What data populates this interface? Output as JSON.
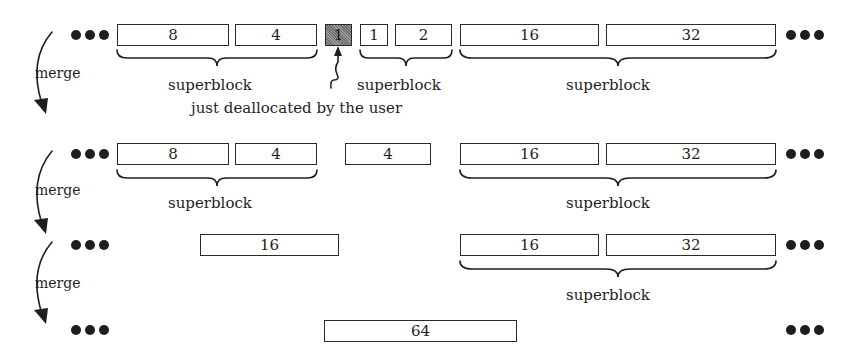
{
  "diagram": {
    "title": "",
    "merge_label": "merge",
    "superblock_label": "superblock",
    "annotation": "just deallocated by the user",
    "rows": [
      {
        "id": "row1",
        "blocks": [
          {
            "size": "8",
            "state": "free"
          },
          {
            "size": "4",
            "state": "free"
          },
          {
            "size": "1",
            "state": "just-deallocated"
          },
          {
            "size": "1",
            "state": "free"
          },
          {
            "size": "2",
            "state": "free"
          },
          {
            "size": "16",
            "state": "free"
          },
          {
            "size": "32",
            "state": "free"
          }
        ],
        "superblocks": [
          "8+4",
          "1+2",
          "16+32"
        ]
      },
      {
        "id": "row2",
        "blocks": [
          {
            "size": "8",
            "state": "free"
          },
          {
            "size": "4",
            "state": "free"
          },
          {
            "size": "4",
            "state": "merged"
          },
          {
            "size": "16",
            "state": "free"
          },
          {
            "size": "32",
            "state": "free"
          }
        ],
        "superblocks": [
          "8+4",
          "16+32"
        ]
      },
      {
        "id": "row3",
        "blocks": [
          {
            "size": "16",
            "state": "merged"
          },
          {
            "size": "16",
            "state": "free"
          },
          {
            "size": "32",
            "state": "free"
          }
        ],
        "superblocks": [
          "16+32"
        ]
      },
      {
        "id": "row4",
        "blocks": [
          {
            "size": "64",
            "state": "merged"
          }
        ],
        "superblocks": []
      }
    ],
    "colors": {
      "ink": "#1e1e1e",
      "freed_fill": "#8a8a8a",
      "background": "#ffffff"
    }
  }
}
